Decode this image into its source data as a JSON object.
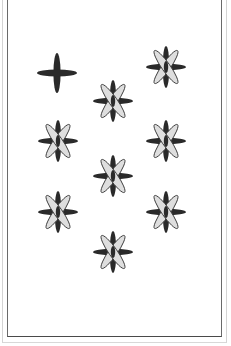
{
  "card": {
    "title": "Eight of Stars",
    "rank": 8,
    "suit": "star",
    "colors": {
      "background": "#ffffff",
      "frame": "#6a6a6a",
      "dark_arm": "#2a2a2a",
      "light_arm": "#dedede",
      "light_arm_outline": "#3a3a3a"
    },
    "pips": [
      {
        "type": "cross",
        "name": "plain-cross-icon",
        "cx": 57,
        "cy": 73
      },
      {
        "type": "star",
        "name": "star-pip-icon",
        "cx": 166,
        "cy": 67
      },
      {
        "type": "star",
        "name": "star-pip-icon",
        "cx": 113,
        "cy": 101
      },
      {
        "type": "star",
        "name": "star-pip-icon",
        "cx": 58,
        "cy": 141
      },
      {
        "type": "star",
        "name": "star-pip-icon",
        "cx": 166,
        "cy": 141
      },
      {
        "type": "star",
        "name": "star-pip-icon",
        "cx": 113,
        "cy": 176
      },
      {
        "type": "star",
        "name": "star-pip-icon",
        "cx": 58,
        "cy": 212
      },
      {
        "type": "star",
        "name": "star-pip-icon",
        "cx": 166,
        "cy": 212
      },
      {
        "type": "star",
        "name": "star-pip-icon",
        "cx": 113,
        "cy": 252
      }
    ]
  }
}
